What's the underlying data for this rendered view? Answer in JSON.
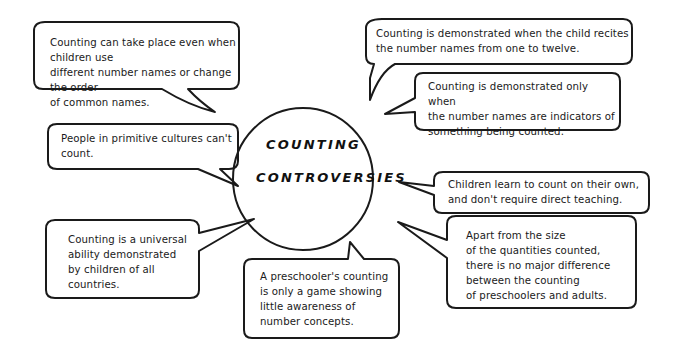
{
  "diagram": {
    "center": {
      "line1": "COUNTING",
      "line2": "CONTROVERSIES"
    },
    "bubbles": [
      {
        "id": "different-names",
        "text": "Counting can take place  even when children use\ndifferent number names  or change the order\nof common names."
      },
      {
        "id": "recites-names",
        "text": "Counting is demonstrated  when the child recites\nthe number names from  one to twelve."
      },
      {
        "id": "indicators",
        "text": "Counting is demonstrated only when\nthe number  names are indicators of\nsomething being counted."
      },
      {
        "id": "primitive-cultures",
        "text": "People in primitive  cultures can't\ncount."
      },
      {
        "id": "learn-on-own",
        "text": "Children learn to count on their own,\nand don't require  direct teaching."
      },
      {
        "id": "universal-ability",
        "text": "Counting is a universal\nability demonstrated\nby children of all\ncountries."
      },
      {
        "id": "preschooler-game",
        "text": "A preschooler's counting\nis only a game showing\nlittle awareness of\nnumber concepts."
      },
      {
        "id": "no-major-difference",
        "text": "Apart from the size\nof the quantities counted,\nthere is no major difference\nbetween the counting\nof preschoolers and  adults."
      }
    ],
    "colors": {
      "ink": "#1a1a1a",
      "background": "#ffffff"
    }
  }
}
